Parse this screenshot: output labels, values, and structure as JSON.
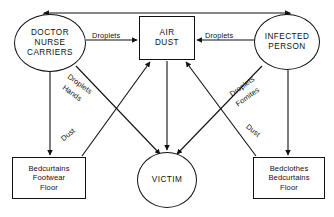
{
  "diagram": {
    "stroke_color": "#111111",
    "background_color": "#ffffff",
    "nodes": [
      {
        "id": "doctor",
        "shape": "circle",
        "lines": [
          "DOCTOR",
          "NURSE",
          "CARRIERS"
        ]
      },
      {
        "id": "air",
        "shape": "rect",
        "lines": [
          "AIR",
          "DUST"
        ]
      },
      {
        "id": "infected",
        "shape": "circle",
        "lines": [
          "INFECTED",
          "PERSON"
        ]
      },
      {
        "id": "bedleft",
        "shape": "rect",
        "lines": [
          "Bedcurtains",
          "Footwear",
          "Floor"
        ]
      },
      {
        "id": "victim",
        "shape": "circle",
        "lines": [
          "VICTIM"
        ]
      },
      {
        "id": "bedright",
        "shape": "rect",
        "lines": [
          "Bedclothes",
          "Bedcurtains",
          "Floor"
        ]
      }
    ],
    "edge_labels": [
      {
        "id": "droplets-left",
        "text": "Droplets",
        "angle": 0
      },
      {
        "id": "droplets-right",
        "text": "Droplets",
        "angle": 0
      },
      {
        "id": "droplets-diag-left",
        "text": "Droplets",
        "angle": 36
      },
      {
        "id": "hands-diag-left",
        "text": "Hands",
        "angle": 36
      },
      {
        "id": "dust-left",
        "text": "Dust",
        "angle": -39
      },
      {
        "id": "droplets-diag-right",
        "text": "Droplets",
        "angle": -36
      },
      {
        "id": "fomites-diag-right",
        "text": "Fomites",
        "angle": -36
      },
      {
        "id": "dust-right",
        "text": "Dust",
        "angle": 39
      }
    ],
    "edges": [
      {
        "from": "doctor",
        "to": "infected",
        "direction": "both",
        "label": ""
      },
      {
        "from": "doctor",
        "to": "air",
        "direction": "forward",
        "label": "Droplets"
      },
      {
        "from": "infected",
        "to": "air",
        "direction": "forward",
        "label": "Droplets"
      },
      {
        "from": "doctor",
        "to": "bedleft",
        "direction": "forward",
        "label": ""
      },
      {
        "from": "infected",
        "to": "bedright",
        "direction": "forward",
        "label": ""
      },
      {
        "from": "doctor",
        "to": "victim",
        "direction": "forward",
        "label": "Droplets Hands"
      },
      {
        "from": "infected",
        "to": "victim",
        "direction": "forward",
        "label": "Droplets Fomites"
      },
      {
        "from": "bedleft",
        "to": "air",
        "direction": "forward",
        "label": "Dust"
      },
      {
        "from": "bedright",
        "to": "air",
        "direction": "forward",
        "label": "Dust"
      },
      {
        "from": "air",
        "to": "victim",
        "direction": "forward",
        "label": ""
      }
    ]
  }
}
